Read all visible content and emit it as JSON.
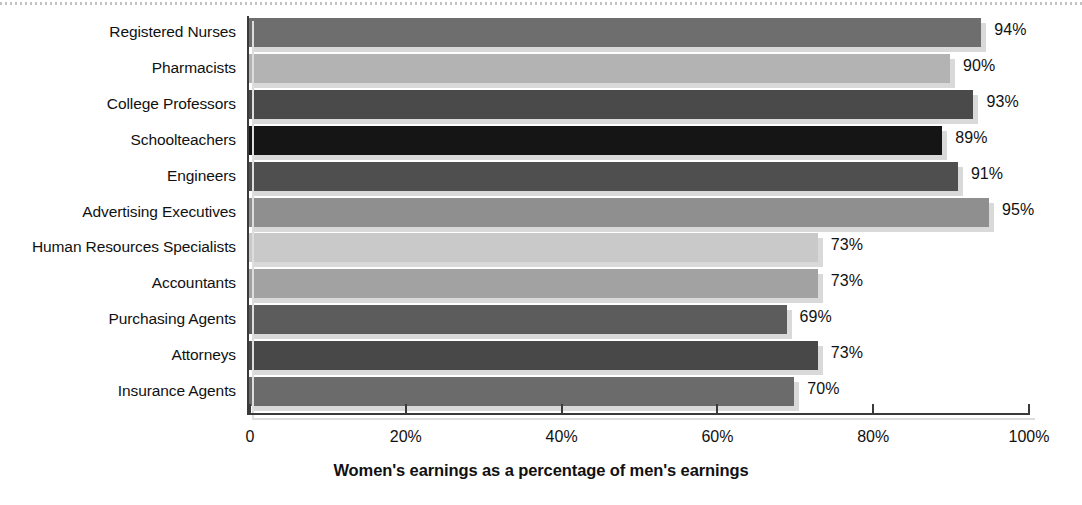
{
  "chart_data": {
    "type": "bar",
    "orientation": "horizontal",
    "title": "",
    "xlabel": "Women's earnings as a percentage of men's earnings",
    "ylabel": "",
    "xlim": [
      0,
      100
    ],
    "grid": false,
    "legend": false,
    "x_ticks": [
      "0",
      "20%",
      "40%",
      "60%",
      "80%",
      "100%"
    ],
    "x_tick_values": [
      0,
      20,
      40,
      60,
      80,
      100
    ],
    "categories": [
      "Registered Nurses",
      "Pharmacists",
      "College Professors",
      "Schoolteachers",
      "Engineers",
      "Advertising Executives",
      "Human Resources Specialists",
      "Accountants",
      "Purchasing Agents",
      "Attorneys",
      "Insurance Agents"
    ],
    "values": [
      94,
      90,
      93,
      89,
      91,
      95,
      73,
      73,
      69,
      73,
      70
    ],
    "value_labels": [
      "94%",
      "90%",
      "93%",
      "89%",
      "91%",
      "95%",
      "73%",
      "73%",
      "69%",
      "73%",
      "70%"
    ],
    "bar_colors": [
      "#6e6e6e",
      "#b3b3b3",
      "#4a4a4a",
      "#151515",
      "#4f4f4f",
      "#8f8f8f",
      "#c9c9c9",
      "#a2a2a2",
      "#5c5c5c",
      "#484848",
      "#6b6b6b"
    ],
    "bar_shadow_color": "#d9d9d9",
    "axis_color": "#3a3a3a",
    "text_color": "#111111",
    "background": "#ffffff"
  }
}
